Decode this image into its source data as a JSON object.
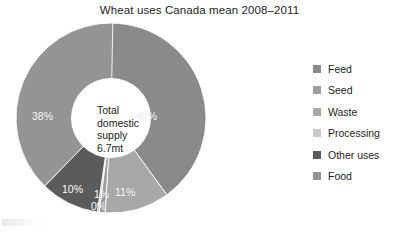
{
  "chart_data": {
    "type": "pie",
    "variant": "donut",
    "title": "Wheat uses Canada mean 2008–2011",
    "xlabel": "",
    "ylabel": "",
    "legend_position": "right",
    "grid": false,
    "center_text": {
      "line1": "Total",
      "line2": "domestic",
      "line3": "supply",
      "line4": "6.7mt"
    },
    "units": "percent of total domestic supply",
    "total_label": "Total domestic supply 6.7mt",
    "total_value": 6.7,
    "total_units": "mt",
    "categories": [
      "Feed",
      "Seed",
      "Waste",
      "Processing",
      "Other uses",
      "Food"
    ],
    "values": [
      40,
      1,
      11,
      0,
      10,
      38
    ],
    "value_labels": [
      "40%",
      "1%",
      "11%",
      "0%",
      "10%",
      "38%"
    ],
    "colors": [
      "#8a8a8a",
      "#9e9e9e",
      "#a8a8a8",
      "#c9c9c9",
      "#5b5b5b",
      "#949494"
    ],
    "slices": [
      {
        "name": "Feed",
        "value": 40,
        "label": "40%",
        "color": "#8a8a8a"
      },
      {
        "name": "Waste",
        "value": 11,
        "label": "11%",
        "color": "#a8a8a8"
      },
      {
        "name": "Seed",
        "value": 1,
        "label": "1%",
        "color": "#9e9e9e"
      },
      {
        "name": "Processing",
        "value": 0,
        "label": "0%",
        "color": "#c9c9c9"
      },
      {
        "name": "Other uses",
        "value": 10,
        "label": "10%",
        "color": "#5b5b5b"
      },
      {
        "name": "Food",
        "value": 38,
        "label": "38%",
        "color": "#949494"
      }
    ]
  },
  "legend": {
    "items": [
      {
        "label": "Feed",
        "color": "#8a8a8a"
      },
      {
        "label": "Seed",
        "color": "#9e9e9e"
      },
      {
        "label": "Waste",
        "color": "#a8a8a8"
      },
      {
        "label": "Processing",
        "color": "#c9c9c9"
      },
      {
        "label": "Other uses",
        "color": "#5b5b5b"
      },
      {
        "label": "Food",
        "color": "#949494"
      }
    ]
  },
  "labels": {
    "feed_pct": "40%",
    "waste_pct": "11%",
    "seed_pct": "1%",
    "processing_pct": "0%",
    "other_uses_pct": "10%",
    "food_pct": "38%"
  }
}
